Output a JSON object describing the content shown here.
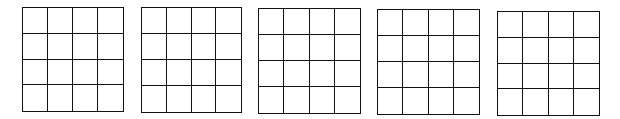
{
  "grids": [
    {
      "rows": 4,
      "cols": 4,
      "x": 22,
      "y": 7,
      "w": 102,
      "h": 105,
      "cells": [
        "",
        "",
        "",
        "",
        "",
        "",
        "",
        "",
        "",
        "",
        "",
        "",
        "",
        "",
        "",
        ""
      ]
    },
    {
      "rows": 4,
      "cols": 4,
      "x": 141,
      "y": 7,
      "w": 101,
      "h": 106,
      "cells": [
        "",
        "",
        "",
        "",
        "",
        "",
        "",
        "",
        "",
        "",
        "",
        "",
        "",
        "",
        "",
        ""
      ]
    },
    {
      "rows": 4,
      "cols": 4,
      "x": 258,
      "y": 8,
      "w": 103,
      "h": 106,
      "cells": [
        "",
        "",
        "",
        "",
        "",
        "",
        "",
        "",
        "",
        "",
        "",
        "",
        "",
        "",
        "",
        ""
      ]
    },
    {
      "rows": 4,
      "cols": 4,
      "x": 377,
      "y": 9,
      "w": 103,
      "h": 106,
      "cells": [
        "",
        "",
        "",
        "",
        "",
        "",
        "",
        "",
        "",
        "",
        "",
        "",
        "",
        "",
        "",
        ""
      ]
    },
    {
      "rows": 4,
      "cols": 4,
      "x": 497,
      "y": 11,
      "w": 103,
      "h": 105,
      "cells": [
        "",
        "",
        "",
        "",
        "",
        "",
        "",
        "",
        "",
        "",
        "",
        "",
        "",
        "",
        "",
        ""
      ]
    }
  ],
  "colors": {
    "line": "#111111",
    "background": "#ffffff"
  }
}
